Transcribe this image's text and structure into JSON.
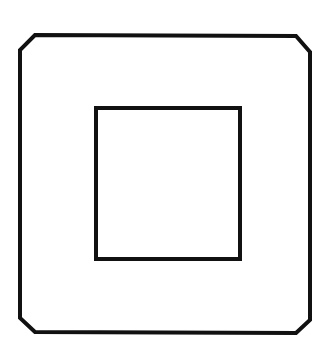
{
  "diagram": {
    "stroke_color": "#111111",
    "background_color": "#ffffff",
    "outer_frame": {
      "shape": "chamfered-square",
      "points": "35,35 296,36 310,52 310,320 296,333 35,332 20,318 20,50"
    },
    "inner_square": {
      "shape": "square",
      "x": 96,
      "y": 108,
      "width": 144,
      "height": 151
    }
  }
}
